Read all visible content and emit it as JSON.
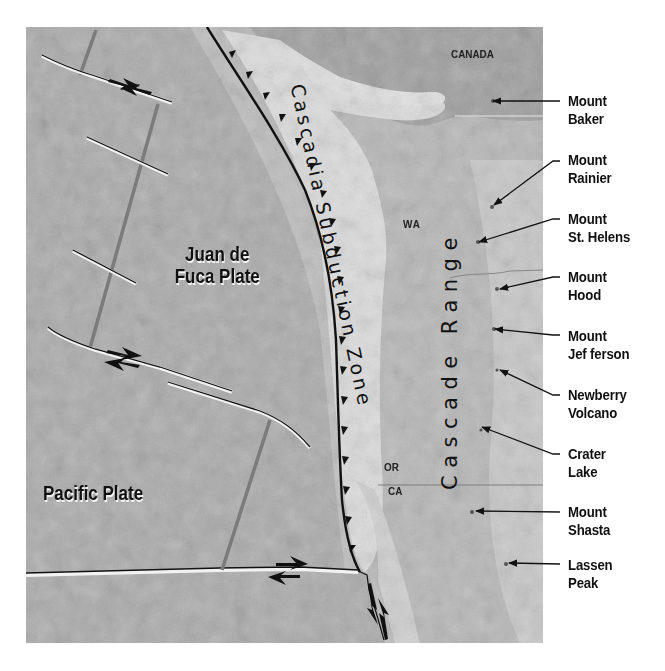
{
  "map": {
    "title_labels": {
      "subduction_zone": "Cascadia Subduction Zone",
      "range": "Cascade Range"
    },
    "plates": [
      {
        "id": "juan-de-fuca",
        "line1": "Juan de",
        "line2": "Fuca Plate"
      },
      {
        "id": "pacific",
        "line1": "Pacific Plate"
      }
    ],
    "regions": {
      "canada": "CANADA",
      "wa": "WA",
      "or": "OR",
      "ca": "CA"
    },
    "volcanoes": [
      {
        "line1": "Mount",
        "line2": "Baker"
      },
      {
        "line1": "Mount",
        "line2": "Rainier"
      },
      {
        "line1": "Mount",
        "line2": "St. Helens"
      },
      {
        "line1": "Mount",
        "line2": "Hood"
      },
      {
        "line1": "Mount",
        "line2": "Jef ferson"
      },
      {
        "line1": "Newberry",
        "line2": "Volcano"
      },
      {
        "line1": "Crater",
        "line2": "Lake"
      },
      {
        "line1": "Mount",
        "line2": "Shasta"
      },
      {
        "line1": "Lassen",
        "line2": "Peak"
      }
    ],
    "colors": {
      "ocean": "#a9a9a9",
      "land": "#b8b8b8",
      "lowland": "#dcdcdc",
      "line": "#111111"
    }
  }
}
